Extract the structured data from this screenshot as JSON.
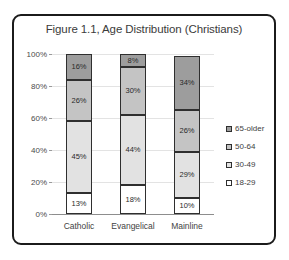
{
  "chart_data": {
    "type": "bar",
    "subtype": "stacked-percent-column",
    "title": "Figure 1.1, Age Distribution (Christians)",
    "xlabel": "",
    "ylabel": "",
    "categories": [
      "Catholic",
      "Evangelical",
      "Mainline"
    ],
    "series": [
      {
        "name": "18-29",
        "values": [
          13,
          18,
          10
        ],
        "color": "#ffffff"
      },
      {
        "name": "30-49",
        "values": [
          45,
          44,
          29
        ],
        "color": "#e2e2e2"
      },
      {
        "name": "50-64",
        "values": [
          26,
          30,
          26
        ],
        "color": "#c4c4c4"
      },
      {
        "name": "65-older",
        "values": [
          16,
          8,
          34
        ],
        "color": "#9d9d9d"
      }
    ],
    "value_labels": {
      "Catholic": [
        "13%",
        "45%",
        "26%",
        "16%"
      ],
      "Evangelical": [
        "18%",
        "44%",
        "30%",
        "8%"
      ],
      "Mainline": [
        "10%",
        "29%",
        "26%",
        "34%"
      ]
    },
    "ylim": [
      0,
      100
    ],
    "yticks": [
      0,
      20,
      40,
      60,
      80,
      100
    ],
    "ytick_labels": [
      "0%",
      "20%",
      "40%",
      "60%",
      "80%",
      "100%"
    ],
    "grid": true,
    "legend_position": "right",
    "legend_entries": [
      "65-older",
      "50-64",
      "30-49",
      "18-29"
    ]
  },
  "frame": {
    "border_color": "#1b1b1b",
    "background": "#ffffff"
  }
}
